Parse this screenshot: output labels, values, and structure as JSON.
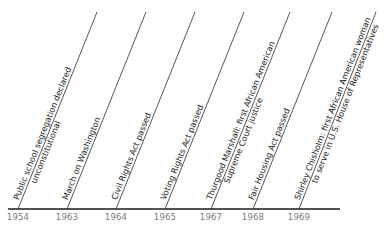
{
  "diagram": {
    "type": "timeline",
    "axis": {
      "x1": 8,
      "x2": 340,
      "y": 209,
      "color": "#1a1a1a"
    },
    "leader_color": "#2b2b2b",
    "year_color": "#7a7a7a",
    "label_color": "#222222",
    "events": [
      {
        "year": "1954",
        "line1": "Public school segregation declared",
        "line2": "unconstitutional",
        "x_base": 18,
        "x_top": 97
      },
      {
        "year": "1963",
        "line1": "March on Washington",
        "line2": "",
        "x_base": 67,
        "x_top": 146
      },
      {
        "year": "1964",
        "line1": "Civil Rights Act passed",
        "line2": "",
        "x_base": 116,
        "x_top": 195
      },
      {
        "year": "1965",
        "line1": "Voting Rights Act passed",
        "line2": "",
        "x_base": 165,
        "x_top": 244
      },
      {
        "year": "1967",
        "line1": "Thurgood Marshall: first African American",
        "line2": "Supreme Court justice",
        "x_base": 211,
        "x_top": 290
      },
      {
        "year": "1968",
        "line1": "Fair Housing Act passed",
        "line2": "",
        "x_base": 253,
        "x_top": 332
      },
      {
        "year": "1969",
        "line1": "Shirley Chisholm: first African American woman",
        "line2": "to serve in U.S. House of Representatives",
        "x_base": 299,
        "x_top": 376
      }
    ]
  }
}
